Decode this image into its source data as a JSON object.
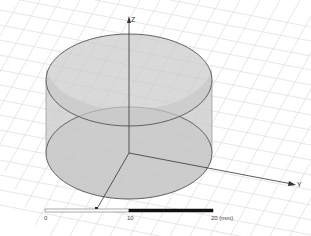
{
  "viewport": {
    "background": "#ffffff",
    "grid_color": "#dcdcdc",
    "solid_fill": "#c8c8c8",
    "solid_edge": "#555555"
  },
  "axes": {
    "x_label": "",
    "y_label": "Y",
    "z_label": "Z"
  },
  "scale_bar": {
    "tick_labels": [
      "0",
      "10",
      "20 (mm)"
    ],
    "left_color": "#ffffff",
    "right_color": "#111111"
  }
}
